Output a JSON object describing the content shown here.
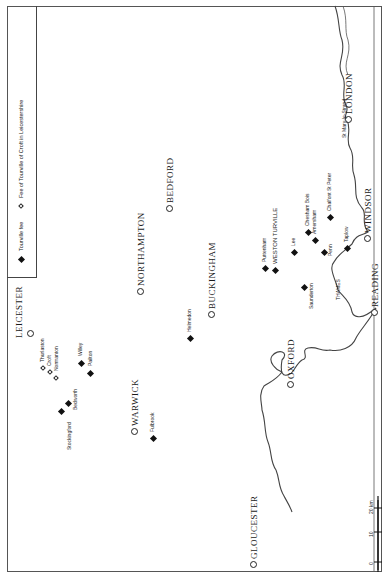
{
  "legend": {
    "tourville_fee": {
      "symbol": "filled-diamond",
      "label": "Tourville fee"
    },
    "croft_fee": {
      "symbol": "open-diamond",
      "label": "Fee of Tourville of Croft in Leicestershire"
    }
  },
  "towns": {
    "leicester": "LEICESTER",
    "warwick": "WARWICK",
    "northampton": "NORTHAMPTON",
    "bedford": "BEDFORD",
    "buckingham": "BUCKINGHAM",
    "oxford": "OXFORD",
    "gloucester": "GLOUCESTER",
    "london": "LONDON",
    "windsor": "WINDSOR",
    "reading": "READING",
    "weston_turville": "WESTON TURVILLE"
  },
  "croft_places": {
    "thurlaston": "Thurlaston",
    "croft": "Croft",
    "normanton": "Normanton"
  },
  "places": {
    "willey": "Willey",
    "pailton": "Pailton",
    "bedworth": "Bedworth",
    "stockingford": "Stockingford",
    "fulbrook": "Fulbrook",
    "helmedon": "Helmedon",
    "puttenham": "Puttenham",
    "lee": "Lee",
    "saunderton": "Saunderton",
    "chesham_bois": "Chesham Bois",
    "amersham": "Amersham",
    "penn": "Penn",
    "chalfont": "Chalfont St Peter",
    "taplow": "Taplow",
    "st_mary": "St Mary-le-Strand"
  },
  "river": {
    "name": "THAMES"
  },
  "scale": {
    "ticks": [
      "10",
      "5",
      "0",
      "10",
      "20 km"
    ],
    "unit": "km"
  }
}
